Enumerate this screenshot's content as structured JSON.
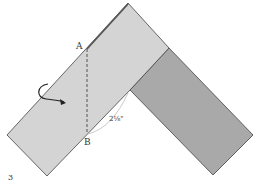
{
  "diagram": {
    "step_number": "3",
    "point_a_label": "A",
    "point_b_label": "B",
    "measurement_label": "2¹⁄₈\"",
    "colors": {
      "light_strip": "#d4d4d4",
      "dark_strip": "#a9a9a9",
      "outline": "#444444",
      "text": "#333333"
    },
    "icons": {
      "fold_arrow": "curved-arrow-icon",
      "fold_line": "dashed-line"
    }
  }
}
